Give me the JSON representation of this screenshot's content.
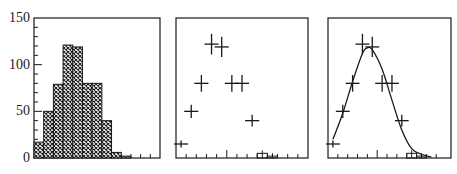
{
  "chart_data": [
    {
      "type": "bar",
      "title": "",
      "xlabel": "",
      "ylabel": "",
      "style": "histogram, cross-hatched fill",
      "ylim": [
        0,
        150
      ],
      "yticks": [
        0,
        50,
        100,
        150
      ],
      "bins": [
        0,
        1,
        2,
        3,
        4,
        5,
        6,
        7,
        8,
        9,
        10,
        11,
        12
      ],
      "values": [
        17,
        50,
        79,
        121,
        119,
        80,
        80,
        40,
        6,
        2,
        0,
        0,
        0
      ],
      "grid": false
    },
    {
      "type": "scatter",
      "title": "",
      "xlabel": "",
      "ylabel": "",
      "style": "data points with horizontal (bin width) and vertical (error) bars",
      "ylim": [
        0,
        150
      ],
      "x": [
        0,
        1,
        2,
        3,
        4,
        5,
        6,
        7,
        8,
        9
      ],
      "values": [
        15,
        50,
        80,
        122,
        119,
        80,
        80,
        40,
        5,
        2
      ],
      "grid": false
    },
    {
      "type": "line",
      "title": "",
      "xlabel": "",
      "ylabel": "",
      "style": "data points with error crosses and fitted smooth curve",
      "ylim": [
        0,
        150
      ],
      "x": [
        0,
        1,
        2,
        3,
        4,
        5,
        6,
        7,
        8,
        9
      ],
      "values": [
        15,
        50,
        80,
        122,
        119,
        80,
        80,
        40,
        5,
        2
      ],
      "fit_curve": {
        "x": [
          0,
          1,
          2,
          3,
          3.5,
          4,
          5,
          6,
          7,
          8,
          9,
          10
        ],
        "y": [
          20,
          48,
          82,
          112,
          118,
          116,
          95,
          62,
          30,
          10,
          4,
          1
        ]
      },
      "grid": false
    }
  ],
  "axis": {
    "ytick_labels": [
      "150",
      "100",
      "50",
      "0"
    ]
  },
  "colors": {
    "ink": "#1a1a1a",
    "background": "#ffffff"
  }
}
